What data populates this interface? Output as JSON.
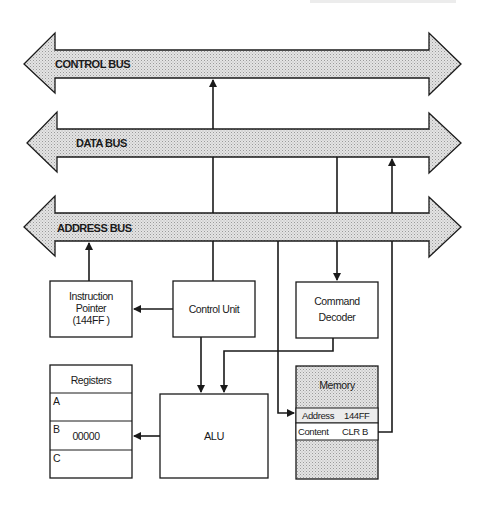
{
  "diagram": {
    "colors": {
      "line": "#1a1a1a",
      "bus_fill": "#d9d9d9",
      "memory_fill": "#dcdcdc",
      "background": "#ffffff"
    },
    "buses": [
      {
        "id": "control",
        "label": "CONTROL BUS"
      },
      {
        "id": "data",
        "label": "DATA BUS"
      },
      {
        "id": "address",
        "label": "ADDRESS BUS"
      }
    ],
    "blocks": {
      "instruction_pointer": {
        "line1": "Instruction",
        "line2": "Pointer",
        "line3": "(144FF )"
      },
      "control_unit": {
        "label": "Control Unit"
      },
      "command_decoder": {
        "line1": "Command",
        "line2": "Decoder"
      },
      "registers": {
        "title": "Registers",
        "rows": [
          {
            "name": "A",
            "value": ""
          },
          {
            "name": "B",
            "value": "00000"
          },
          {
            "name": "C",
            "value": ""
          }
        ]
      },
      "alu": {
        "label": "ALU"
      },
      "memory": {
        "title": "Memory",
        "address_label": "Address",
        "address_value": "144FF",
        "content_label": "Content",
        "content_value": "CLR B"
      }
    }
  }
}
